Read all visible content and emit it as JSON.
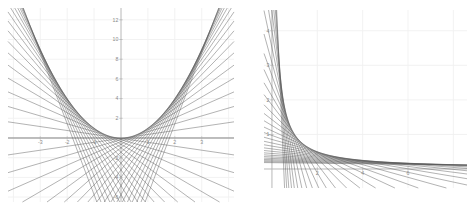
{
  "figure": {
    "title": "",
    "background_color": "#ffffff",
    "panel_count": 2
  },
  "style": {
    "grid_color": "#f0f0f0",
    "axis_color": "#b0b0b0",
    "line_color": "#555555",
    "tick_label_color": "#8a8a8a",
    "line_width": 0.45
  },
  "chart_data": [
    {
      "type": "line",
      "name": "parabola-envelope",
      "title": "",
      "xlabel": "",
      "ylabel": "",
      "curve": "y = x^2",
      "description": "Family of tangent lines to the parabola y = x^2; their envelope traces the parabola.",
      "tangent_line_formula": "y = 2*a*x - a^2",
      "tangent_parameters_a": [
        -3.6,
        -3.4,
        -3.2,
        -3.0,
        -2.8,
        -2.6,
        -2.4,
        -2.2,
        -2.0,
        -1.8,
        -1.6,
        -1.4,
        -1.2,
        -1.0,
        -0.8,
        -0.6,
        -0.4,
        -0.2,
        0.0,
        0.2,
        0.4,
        0.6,
        0.8,
        1.0,
        1.2,
        1.4,
        1.6,
        1.8,
        2.0,
        2.2,
        2.4,
        2.6,
        2.8,
        3.0,
        3.2,
        3.4,
        3.6
      ],
      "tangent_line_count": 37,
      "xlim": [
        -4.2,
        4.2
      ],
      "ylim": [
        -6.5,
        13.2
      ],
      "xticks": [
        -3,
        -2,
        -1,
        1,
        2,
        3
      ],
      "xticklabels": [
        "-3",
        "-2",
        "-1",
        "1",
        "2",
        "3"
      ],
      "yticks": [
        -6,
        -4,
        -2,
        2,
        4,
        6,
        8,
        10,
        12
      ],
      "yticklabels": [
        "-6",
        "-4",
        "-2",
        "2",
        "4",
        "6",
        "8",
        "10",
        "12"
      ],
      "grid": true,
      "grid_spacing_x": 1,
      "grid_spacing_y": 2,
      "legend": "none",
      "axes_through_origin": true
    },
    {
      "type": "line",
      "name": "hyperbola-envelope",
      "title": "",
      "xlabel": "",
      "ylabel": "",
      "curve": "y = 1/x",
      "description": "Family of tangent lines to the hyperbola y = 1/x in the first quadrant; their envelope traces the hyperbola.",
      "tangent_line_formula": "y = -x/a^2 + 2/a",
      "tangent_parameters_a": [
        0.26,
        0.3,
        0.34,
        0.39,
        0.44,
        0.5,
        0.57,
        0.65,
        0.74,
        0.84,
        0.95,
        1.08,
        1.23,
        1.4,
        1.59,
        1.81,
        2.06,
        2.34,
        2.66,
        3.02,
        3.44,
        3.91,
        4.45,
        5.06,
        5.75,
        6.54,
        7.44,
        8.46,
        9.62,
        10.94
      ],
      "tangent_line_count": 30,
      "xlim": [
        -0.35,
        8.6
      ],
      "ylim": [
        -0.55,
        4.6
      ],
      "xticks": [
        2,
        4,
        6
      ],
      "xticklabels": [
        "2",
        "4",
        "6"
      ],
      "yticks": [
        1,
        2,
        3,
        4
      ],
      "yticklabels": [
        "1",
        "2",
        "3",
        "4"
      ],
      "grid": true,
      "grid_spacing_x": 2,
      "grid_spacing_y": 1,
      "legend": "none",
      "axes_through_origin": true
    }
  ]
}
